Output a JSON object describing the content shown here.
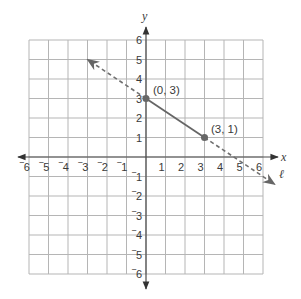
{
  "chart_data": {
    "type": "line",
    "title": "",
    "xlabel": "x",
    "ylabel": "y",
    "xlim": [
      -6,
      6
    ],
    "ylim": [
      -6,
      6
    ],
    "grid": true,
    "x_ticks": [
      "‾6",
      "‾5",
      "‾4",
      "‾3",
      "‾2",
      "‾1",
      "1",
      "2",
      "3",
      "4",
      "5",
      "6"
    ],
    "y_ticks": [
      "6",
      "5",
      "4",
      "3",
      "2",
      "1",
      "‾1",
      "‾2",
      "‾3",
      "‾4",
      "‾5",
      "‾6"
    ],
    "line_label": "ℓ",
    "points": [
      {
        "x": 0,
        "y": 3,
        "label": "(0, 3)"
      },
      {
        "x": 3,
        "y": 1,
        "label": "(3, 1)"
      }
    ],
    "segment": {
      "from": [
        0,
        3
      ],
      "to": [
        3,
        1
      ],
      "style": "solid"
    },
    "extensions": [
      {
        "from": [
          0,
          3
        ],
        "to": [
          -3,
          5
        ],
        "style": "dashed",
        "arrow": true
      },
      {
        "from": [
          3,
          1
        ],
        "to": [
          6.6,
          -1.4
        ],
        "style": "dashed",
        "arrow": true
      }
    ],
    "colors": {
      "grid": "#b5b5b5",
      "axis": "#4a4a4a",
      "line": "#666666",
      "point": "#666666"
    }
  }
}
